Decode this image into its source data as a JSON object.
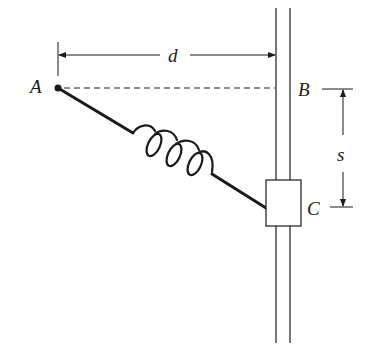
{
  "diagram": {
    "labels": {
      "point_a": "A",
      "point_b": "B",
      "point_c": "C",
      "distance_d": "d",
      "displacement_s": "s"
    },
    "colors": {
      "stroke": "#1a1a1a",
      "background": "#ffffff"
    }
  }
}
